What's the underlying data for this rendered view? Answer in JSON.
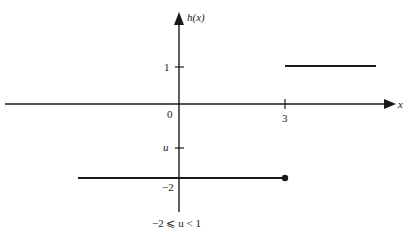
{
  "diagram": {
    "function_label": "h(x)",
    "function_name": "h",
    "function_arg": "x",
    "x_axis_label": "x",
    "origin_label": "0",
    "y_tick_labels": {
      "one": "1",
      "u": "u",
      "neg_two": "−2"
    },
    "x_tick_labels": {
      "three": "3"
    },
    "condition": "−2 ⩽ u < 1",
    "segments": [
      {
        "name": "upper",
        "y": 1,
        "x_from": 3,
        "x_to": "+inf",
        "endpoint_at_3": "none"
      },
      {
        "name": "lower",
        "y": -2,
        "x_from": "-inf",
        "x_to": 3,
        "endpoint_at_3": "closed"
      }
    ],
    "colors": {
      "ink": "#1a1a1a",
      "background": "#ffffff"
    }
  }
}
